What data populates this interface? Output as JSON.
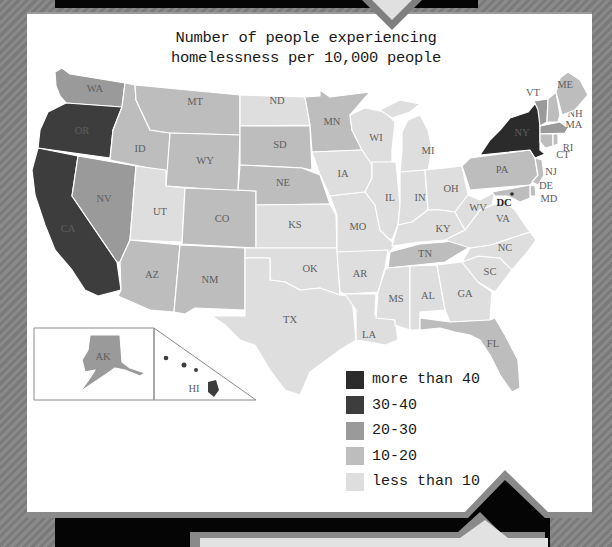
{
  "title": {
    "line1": "Number of people experiencing",
    "line2": "homelessness per 10,000 people"
  },
  "colors": {
    "more_than_40": "#2b2b2b",
    "30_40": "#3d3d3d",
    "20_30": "#9a9a9a",
    "10_20": "#bdbdbd",
    "less_than_10": "#dedede",
    "frame_black": "#050505",
    "frame_gray": "#7f7f7f",
    "card_white": "#ffffff"
  },
  "legend": [
    {
      "label": "more than 40",
      "bin": "more_than_40",
      "color": "#2b2b2b"
    },
    {
      "label": "30-40",
      "bin": "30_40",
      "color": "#3d3d3d"
    },
    {
      "label": "20-30",
      "bin": "20_30",
      "color": "#9a9a9a"
    },
    {
      "label": "10-20",
      "bin": "10_20",
      "color": "#bdbdbd"
    },
    {
      "label": "less than 10",
      "bin": "less_than_10",
      "color": "#dedede"
    }
  ],
  "states": {
    "WA": {
      "label": "WA",
      "bin": "20_30"
    },
    "OR": {
      "label": "OR",
      "bin": "30_40"
    },
    "CA": {
      "label": "CA",
      "bin": "30_40"
    },
    "ID": {
      "label": "ID",
      "bin": "10_20"
    },
    "NV": {
      "label": "NV",
      "bin": "20_30"
    },
    "MT": {
      "label": "MT",
      "bin": "10_20"
    },
    "WY": {
      "label": "WY",
      "bin": "10_20"
    },
    "UT": {
      "label": "UT",
      "bin": "less_than_10"
    },
    "AZ": {
      "label": "AZ",
      "bin": "10_20"
    },
    "CO": {
      "label": "CO",
      "bin": "10_20"
    },
    "NM": {
      "label": "NM",
      "bin": "10_20"
    },
    "ND": {
      "label": "ND",
      "bin": "less_than_10"
    },
    "SD": {
      "label": "SD",
      "bin": "10_20"
    },
    "NE": {
      "label": "NE",
      "bin": "10_20"
    },
    "KS": {
      "label": "KS",
      "bin": "less_than_10"
    },
    "OK": {
      "label": "OK",
      "bin": "less_than_10"
    },
    "TX": {
      "label": "TX",
      "bin": "less_than_10"
    },
    "MN": {
      "label": "MN",
      "bin": "10_20"
    },
    "IA": {
      "label": "IA",
      "bin": "less_than_10"
    },
    "MO": {
      "label": "MO",
      "bin": "less_than_10"
    },
    "AR": {
      "label": "AR",
      "bin": "less_than_10"
    },
    "LA": {
      "label": "LA",
      "bin": "less_than_10"
    },
    "WI": {
      "label": "WI",
      "bin": "less_than_10"
    },
    "IL": {
      "label": "IL",
      "bin": "less_than_10"
    },
    "MI": {
      "label": "MI",
      "bin": "less_than_10"
    },
    "IN": {
      "label": "IN",
      "bin": "less_than_10"
    },
    "OH": {
      "label": "OH",
      "bin": "less_than_10"
    },
    "KY": {
      "label": "KY",
      "bin": "less_than_10"
    },
    "TN": {
      "label": "TN",
      "bin": "10_20"
    },
    "MS": {
      "label": "MS",
      "bin": "less_than_10"
    },
    "AL": {
      "label": "AL",
      "bin": "less_than_10"
    },
    "GA": {
      "label": "GA",
      "bin": "less_than_10"
    },
    "FL": {
      "label": "FL",
      "bin": "10_20"
    },
    "SC": {
      "label": "SC",
      "bin": "less_than_10"
    },
    "NC": {
      "label": "NC",
      "bin": "less_than_10"
    },
    "VA": {
      "label": "VA",
      "bin": "less_than_10"
    },
    "WV": {
      "label": "WV",
      "bin": "less_than_10"
    },
    "PA": {
      "label": "PA",
      "bin": "10_20"
    },
    "NY": {
      "label": "NY",
      "bin": "more_than_40"
    },
    "VT": {
      "label": "VT",
      "bin": "20_30"
    },
    "NH": {
      "label": "NH",
      "bin": "10_20"
    },
    "ME": {
      "label": "ME",
      "bin": "10_20"
    },
    "MA": {
      "label": "MA",
      "bin": "20_30"
    },
    "RI": {
      "label": "RI",
      "bin": "10_20"
    },
    "CT": {
      "label": "CT",
      "bin": "10_20"
    },
    "NJ": {
      "label": "NJ",
      "bin": "10_20"
    },
    "DE": {
      "label": "DE",
      "bin": "10_20"
    },
    "MD": {
      "label": "MD",
      "bin": "10_20"
    },
    "DC": {
      "label": "DC",
      "bin": "more_than_40"
    },
    "AK": {
      "label": "AK",
      "bin": "20_30"
    },
    "HI": {
      "label": "HI",
      "bin": "30_40"
    }
  }
}
